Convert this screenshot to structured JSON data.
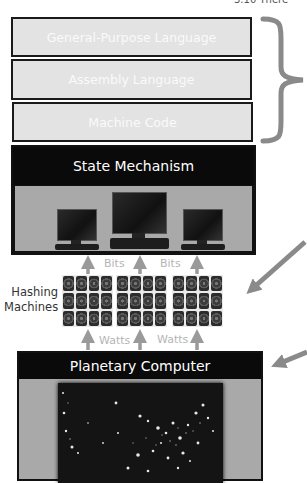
{
  "corner_text": "3.10 There",
  "software_layers": [
    {
      "label": "General-Purpose Language"
    },
    {
      "label": "Assembly Language"
    },
    {
      "label": "Machine Code"
    }
  ],
  "state_mechanism": {
    "title": "State Mechanism",
    "computers": 3
  },
  "hashing": {
    "side_label_line1": "Hashing",
    "side_label_line2": "Machines",
    "bits_labels": [
      "Bits",
      "Bits"
    ],
    "watts_labels": [
      "Watts",
      "Watts"
    ],
    "racks": 3,
    "rack_grid": {
      "cols": 4,
      "rows": 3
    }
  },
  "planetary_computer": {
    "title": "Planetary Computer",
    "image": "night-lights-map-of-united-states"
  },
  "colors": {
    "layer_fill": "#e3e3e3",
    "header_black": "#0a0a0a",
    "body_grey": "#a9a9a9",
    "arrow_grey": "#999999",
    "brace_grey": "#8a8a8a"
  }
}
